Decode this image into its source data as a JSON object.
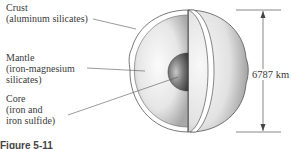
{
  "labels": {
    "crust": {
      "name": "Crust",
      "composition": "(aluminum silicates)"
    },
    "mantle": {
      "name": "Mantle",
      "composition_line1": "(iron-magnesium",
      "composition_line2": "silicates)"
    },
    "core": {
      "name": "Core",
      "composition_line1": "(iron and",
      "composition_line2": "iron sulfide)"
    }
  },
  "scale": {
    "diameter_label": "6787 km"
  },
  "caption": {
    "text": "Figure 5-11"
  },
  "colors": {
    "line": "#555555",
    "sphere_light": "#f4f4f4",
    "sphere_dark": "#9a9a9a",
    "core_dark": "#4a4a4a",
    "core_light": "#b8b8b8"
  }
}
